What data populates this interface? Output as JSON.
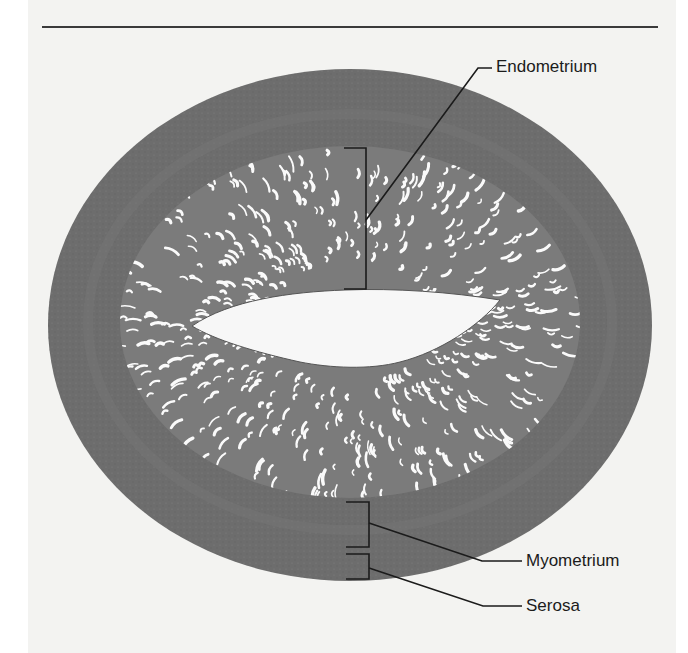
{
  "figure": {
    "type": "histology-cross-section",
    "colors": {
      "background": "#f3f3f1",
      "myometrium": "#6e6e6e",
      "endometrium": "#7d7d7d",
      "lumen": "#f7f7f7",
      "glands": "#fafafa",
      "leader_lines": "#1b1b1b"
    },
    "labels": [
      {
        "id": "endometrium",
        "text": "Endometrium"
      },
      {
        "id": "myometrium",
        "text": "Myometrium"
      },
      {
        "id": "serosa",
        "text": "Serosa"
      }
    ]
  }
}
